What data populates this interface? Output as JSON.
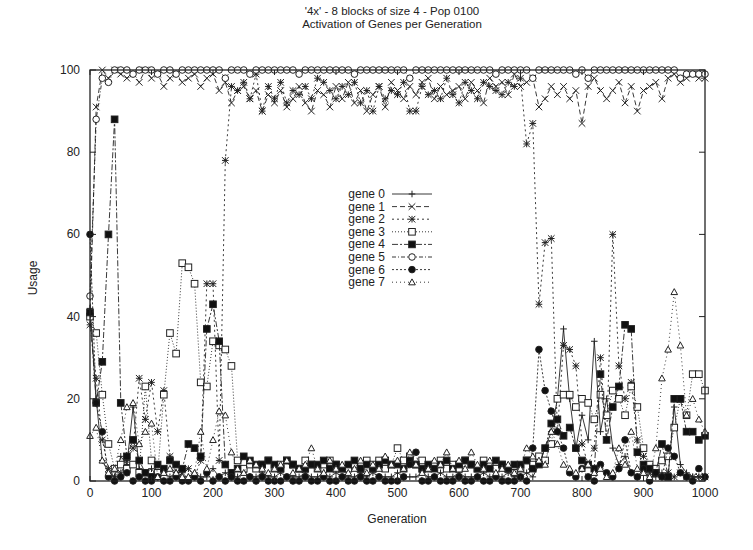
{
  "chart_data": {
    "type": "line",
    "title": "'4x' - 8 blocks of size 4 - Pop 0100",
    "subtitle": "Activation of Genes per Generation",
    "xlabel": "Generation",
    "ylabel": "Usage",
    "xlim": [
      0,
      1000
    ],
    "ylim": [
      0,
      100
    ],
    "xticks": [
      0,
      100,
      200,
      300,
      400,
      500,
      600,
      700,
      800,
      900,
      1000
    ],
    "yticks": [
      0,
      20,
      40,
      60,
      80,
      100
    ],
    "grid": false,
    "legend_position": "inside-center",
    "x": [
      0,
      10,
      20,
      30,
      40,
      50,
      60,
      70,
      80,
      90,
      100,
      110,
      120,
      130,
      140,
      150,
      160,
      170,
      180,
      190,
      200,
      210,
      220,
      230,
      240,
      250,
      260,
      270,
      280,
      290,
      300,
      310,
      320,
      330,
      340,
      350,
      360,
      370,
      380,
      390,
      400,
      410,
      420,
      430,
      440,
      450,
      460,
      470,
      480,
      490,
      500,
      510,
      520,
      530,
      540,
      550,
      560,
      570,
      580,
      590,
      600,
      610,
      620,
      630,
      640,
      650,
      660,
      670,
      680,
      690,
      700,
      710,
      720,
      730,
      740,
      750,
      760,
      770,
      780,
      790,
      800,
      810,
      820,
      830,
      840,
      850,
      860,
      870,
      880,
      890,
      900,
      910,
      920,
      930,
      940,
      950,
      960,
      970,
      980,
      990,
      1000
    ],
    "series": [
      {
        "name": "gene 0",
        "marker": "plus",
        "dash": "",
        "values": [
          42,
          20,
          5,
          2,
          1,
          6,
          4,
          18,
          3,
          2,
          3,
          1,
          2,
          1,
          2,
          1,
          1,
          2,
          1,
          1,
          3,
          1,
          2,
          1,
          1,
          2,
          1,
          1,
          2,
          1,
          1,
          2,
          1,
          1,
          1,
          2,
          1,
          1,
          2,
          1,
          2,
          1,
          1,
          1,
          2,
          1,
          2,
          1,
          1,
          1,
          2,
          1,
          1,
          1,
          2,
          1,
          1,
          2,
          1,
          1,
          2,
          1,
          1,
          1,
          2,
          1,
          1,
          1,
          2,
          1,
          1,
          2,
          1,
          4,
          8,
          12,
          20,
          37,
          20,
          8,
          16,
          10,
          34,
          12,
          20,
          8,
          4,
          6,
          2,
          1,
          3,
          1,
          1,
          2,
          1,
          18,
          4,
          2,
          1,
          1,
          1
        ]
      },
      {
        "name": "gene 1",
        "marker": "x",
        "dash": "5,3",
        "values": [
          40,
          91,
          100,
          98,
          100,
          99,
          98,
          99,
          97,
          100,
          98,
          99,
          96,
          98,
          99,
          97,
          98,
          99,
          96,
          98,
          99,
          95,
          97,
          92,
          95,
          96,
          93,
          95,
          90,
          94,
          92,
          95,
          91,
          93,
          96,
          92,
          90,
          95,
          94,
          91,
          96,
          93,
          97,
          92,
          95,
          90,
          94,
          96,
          91,
          97,
          95,
          93,
          96,
          94,
          97,
          98,
          93,
          96,
          94,
          95,
          96,
          93,
          97,
          95,
          92,
          98,
          96,
          97,
          94,
          99,
          96,
          97,
          98,
          91,
          93,
          96,
          94,
          96,
          93,
          95,
          87,
          96,
          98,
          95,
          93,
          95,
          97,
          92,
          96,
          90,
          95,
          96,
          97,
          93,
          98,
          99,
          97,
          98,
          99,
          98,
          98
        ]
      },
      {
        "name": "gene 2",
        "marker": "star",
        "dash": "2,3",
        "values": [
          38,
          25,
          10,
          3,
          1,
          2,
          5,
          8,
          25,
          15,
          24,
          12,
          22,
          6,
          2,
          2,
          3,
          1,
          5,
          48,
          48,
          5,
          78,
          96,
          95,
          97,
          93,
          99,
          90,
          96,
          93,
          97,
          92,
          95,
          94,
          96,
          93,
          98,
          97,
          95,
          93,
          96,
          94,
          97,
          92,
          95,
          90,
          96,
          93,
          95,
          94,
          97,
          90,
          90,
          96,
          94,
          95,
          93,
          98,
          94,
          92,
          97,
          95,
          93,
          97,
          96,
          95,
          94,
          97,
          96,
          98,
          82,
          87,
          43,
          58,
          59,
          12,
          33,
          32,
          28,
          9,
          4,
          8,
          30,
          10,
          60,
          28,
          20,
          24,
          10,
          6,
          2,
          2,
          1,
          2,
          1,
          2,
          1,
          1,
          1,
          1
        ]
      },
      {
        "name": "gene 3",
        "marker": "square",
        "dash": "1,2",
        "values": [
          40,
          36,
          21,
          9,
          3,
          4,
          3,
          4,
          2,
          23,
          5,
          2,
          21,
          36,
          31,
          53,
          52,
          48,
          24,
          23,
          34,
          33,
          32,
          28,
          5,
          3,
          4,
          3,
          4,
          5,
          3,
          4,
          5,
          4,
          3,
          5,
          4,
          3,
          4,
          5,
          4,
          3,
          3,
          4,
          3,
          5,
          4,
          5,
          3,
          4,
          8,
          5,
          6,
          4,
          5,
          3,
          4,
          5,
          3,
          4,
          3,
          5,
          4,
          3,
          5,
          4,
          3,
          4,
          3,
          2,
          3,
          5,
          4,
          6,
          5,
          9,
          20,
          21,
          21,
          18,
          20,
          19,
          15,
          21,
          16,
          22,
          20,
          16,
          23,
          18,
          8,
          4,
          3,
          5,
          6,
          13,
          20,
          16,
          26,
          26,
          22
        ]
      },
      {
        "name": "gene 4",
        "marker": "filled-square",
        "dash": "6,2,2,2",
        "values": [
          41,
          19,
          29,
          60,
          88,
          19,
          6,
          10,
          5,
          2,
          1,
          4,
          3,
          5,
          4,
          3,
          9,
          8,
          6,
          37,
          43,
          34,
          4,
          2,
          3,
          6,
          5,
          4,
          4,
          5,
          4,
          3,
          5,
          4,
          3,
          3,
          4,
          4,
          5,
          3,
          4,
          3,
          4,
          5,
          3,
          4,
          3,
          4,
          5,
          4,
          4,
          3,
          5,
          4,
          3,
          4,
          3,
          4,
          5,
          3,
          4,
          5,
          4,
          3,
          4,
          3,
          5,
          4,
          3,
          4,
          4,
          5,
          3,
          4,
          8,
          14,
          15,
          11,
          13,
          8,
          5,
          4,
          3,
          26,
          10,
          18,
          23,
          38,
          37,
          7,
          4,
          3,
          2,
          9,
          1,
          20,
          20,
          12,
          12,
          10,
          11
        ]
      },
      {
        "name": "gene 5",
        "marker": "circle",
        "dash": "4,2,1,2",
        "values": [
          45,
          88,
          98,
          97,
          100,
          100,
          100,
          99,
          100,
          100,
          100,
          99,
          100,
          100,
          99,
          100,
          100,
          100,
          100,
          100,
          100,
          100,
          98,
          100,
          100,
          100,
          99,
          100,
          100,
          100,
          100,
          100,
          100,
          100,
          99,
          100,
          100,
          100,
          100,
          100,
          100,
          100,
          100,
          99,
          100,
          100,
          100,
          100,
          100,
          100,
          100,
          100,
          98,
          100,
          100,
          100,
          100,
          100,
          100,
          100,
          100,
          100,
          100,
          100,
          100,
          100,
          99,
          100,
          100,
          100,
          100,
          100,
          98,
          100,
          100,
          100,
          100,
          100,
          100,
          99,
          100,
          98,
          100,
          100,
          100,
          100,
          100,
          100,
          100,
          100,
          100,
          100,
          100,
          100,
          100,
          100,
          98,
          99,
          99,
          99,
          99
        ]
      },
      {
        "name": "gene 6",
        "marker": "filled-circle",
        "dash": "2,2",
        "values": [
          60,
          19,
          12,
          1,
          0,
          1,
          2,
          0,
          1,
          0,
          0,
          1,
          0,
          0,
          1,
          0,
          0,
          1,
          0,
          2,
          0,
          1,
          0,
          1,
          0,
          0,
          1,
          0,
          1,
          0,
          0,
          0,
          1,
          0,
          0,
          1,
          0,
          0,
          1,
          0,
          0,
          1,
          0,
          0,
          1,
          0,
          0,
          1,
          0,
          0,
          0,
          1,
          4,
          7,
          0,
          0,
          1,
          0,
          0,
          0,
          1,
          0,
          0,
          1,
          0,
          0,
          1,
          0,
          0,
          0,
          1,
          0,
          8,
          32,
          22,
          17,
          12,
          8,
          2,
          1,
          3,
          1,
          0,
          4,
          2,
          1,
          3,
          10,
          2,
          1,
          3,
          0,
          2,
          1,
          8,
          6,
          2,
          1,
          0,
          3,
          1
        ]
      },
      {
        "name": "gene 7",
        "marker": "triangle",
        "dash": "1,3",
        "values": [
          11,
          13,
          5,
          2,
          3,
          10,
          18,
          19,
          9,
          12,
          14,
          1,
          2,
          3,
          2,
          1,
          1,
          2,
          12,
          3,
          10,
          17,
          16,
          7,
          3,
          2,
          5,
          4,
          3,
          2,
          3,
          4,
          5,
          2,
          3,
          4,
          8,
          3,
          2,
          5,
          3,
          4,
          2,
          3,
          5,
          2,
          4,
          3,
          6,
          4,
          5,
          3,
          7,
          4,
          2,
          3,
          5,
          4,
          7,
          3,
          5,
          3,
          7,
          4,
          3,
          5,
          2,
          3,
          4,
          2,
          3,
          8,
          6,
          5,
          4,
          12,
          9,
          4,
          3,
          2,
          3,
          4,
          2,
          3,
          1,
          2,
          8,
          4,
          12,
          3,
          2,
          1,
          8,
          25,
          32,
          46,
          33,
          16,
          20,
          15,
          12
        ]
      }
    ]
  },
  "legend": {
    "items": [
      "gene 0",
      "gene 1",
      "gene 2",
      "gene 3",
      "gene 4",
      "gene 5",
      "gene 6",
      "gene 7"
    ]
  }
}
